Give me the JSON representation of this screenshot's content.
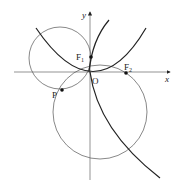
{
  "diagram": {
    "axes": {
      "x_label": "x",
      "y_label": "y",
      "origin_label": "O"
    },
    "points": [
      {
        "name": "F1",
        "label": "F",
        "sub": "1"
      },
      {
        "name": "F2",
        "label": "F",
        "sub": "2"
      },
      {
        "name": "P",
        "label": "P"
      }
    ],
    "curves": [
      "upper-left circle",
      "lower-right circle",
      "parabola opening up",
      "curve through origin descending to lower right"
    ],
    "colors": {
      "stroke": "#222222",
      "thin": "#555555"
    }
  }
}
